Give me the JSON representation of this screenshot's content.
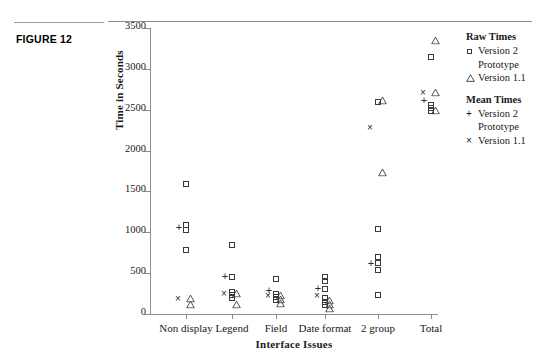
{
  "figure": {
    "label": "FIGURE 12"
  },
  "legend": {
    "groups": [
      {
        "heading": "Raw Times",
        "entries": [
          {
            "symbol": "square",
            "label": "Version 2",
            "label2": "Prototype"
          },
          {
            "symbol": "triangle",
            "label": "Version 1.1",
            "label2": ""
          }
        ]
      },
      {
        "heading": "Mean Times",
        "entries": [
          {
            "symbol": "plus",
            "label": "Version 2",
            "label2": "Prototype"
          },
          {
            "symbol": "cross",
            "label": "Version 1.1",
            "label2": ""
          }
        ]
      }
    ]
  },
  "chart_data": {
    "type": "scatter",
    "title": "",
    "xlabel": "Interface Issues",
    "ylabel": "Time in Seconds",
    "ylim": [
      0,
      3500
    ],
    "yticks": [
      0,
      500,
      1000,
      1500,
      2000,
      2500,
      3000,
      3500
    ],
    "ytick_labels": [
      "0",
      "500",
      "1000",
      "1500",
      "2000",
      "2500",
      "3000",
      "3500"
    ],
    "grid": false,
    "legend_position": "right",
    "categories": [
      "Non display",
      "Legend",
      "Field",
      "Date format",
      "2 group",
      "Total"
    ],
    "series": [
      {
        "name": "Raw Times Version 2 Prototype",
        "symbol": "square",
        "points": [
          {
            "category": "Non display",
            "value": 1590
          },
          {
            "category": "Non display",
            "value": 1090
          },
          {
            "category": "Non display",
            "value": 1030
          },
          {
            "category": "Non display",
            "value": 780
          },
          {
            "category": "Legend",
            "value": 840
          },
          {
            "category": "Legend",
            "value": 450
          },
          {
            "category": "Legend",
            "value": 270
          },
          {
            "category": "Legend",
            "value": 230
          },
          {
            "category": "Legend",
            "value": 200
          },
          {
            "category": "Field",
            "value": 430
          },
          {
            "category": "Field",
            "value": 250
          },
          {
            "category": "Field",
            "value": 210
          },
          {
            "category": "Field",
            "value": 170
          },
          {
            "category": "Date format",
            "value": 450
          },
          {
            "category": "Date format",
            "value": 400
          },
          {
            "category": "Date format",
            "value": 310
          },
          {
            "category": "Date format",
            "value": 190
          },
          {
            "category": "Date format",
            "value": 150
          },
          {
            "category": "Date format",
            "value": 110
          },
          {
            "category": "2 group",
            "value": 2600
          },
          {
            "category": "2 group",
            "value": 1040
          },
          {
            "category": "2 group",
            "value": 700
          },
          {
            "category": "2 group",
            "value": 620
          },
          {
            "category": "2 group",
            "value": 540
          },
          {
            "category": "2 group",
            "value": 230
          },
          {
            "category": "Total",
            "value": 3150
          },
          {
            "category": "Total",
            "value": 2560
          },
          {
            "category": "Total",
            "value": 2520
          },
          {
            "category": "Total",
            "value": 2480
          }
        ]
      },
      {
        "name": "Raw Times Version 1.1",
        "symbol": "triangle",
        "points": [
          {
            "category": "Non display",
            "value": 200
          },
          {
            "category": "Non display",
            "value": 120
          },
          {
            "category": "Legend",
            "value": 260
          },
          {
            "category": "Legend",
            "value": 120
          },
          {
            "category": "Field",
            "value": 230
          },
          {
            "category": "Field",
            "value": 180
          },
          {
            "category": "Field",
            "value": 130
          },
          {
            "category": "Date format",
            "value": 170
          },
          {
            "category": "Date format",
            "value": 120
          },
          {
            "category": "Date format",
            "value": 70
          },
          {
            "category": "2 group",
            "value": 2620
          },
          {
            "category": "2 group",
            "value": 1740
          },
          {
            "category": "Total",
            "value": 3350
          },
          {
            "category": "Total",
            "value": 2720
          },
          {
            "category": "Total",
            "value": 2500
          }
        ]
      },
      {
        "name": "Mean Times Version 2 Prototype",
        "symbol": "plus",
        "points": [
          {
            "category": "Non display",
            "value": 1060
          },
          {
            "category": "Legend",
            "value": 460
          },
          {
            "category": "Field",
            "value": 290
          },
          {
            "category": "Date format",
            "value": 320
          },
          {
            "category": "2 group",
            "value": 620
          },
          {
            "category": "Total",
            "value": 2620
          }
        ]
      },
      {
        "name": "Mean Times Version 1.1",
        "symbol": "cross",
        "points": [
          {
            "category": "Non display",
            "value": 180
          },
          {
            "category": "Legend",
            "value": 250
          },
          {
            "category": "Field",
            "value": 225
          },
          {
            "category": "Date format",
            "value": 215
          },
          {
            "category": "2 group",
            "value": 2280
          },
          {
            "category": "Total",
            "value": 2700
          }
        ]
      }
    ]
  }
}
